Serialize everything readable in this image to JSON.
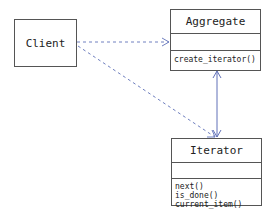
{
  "diagram": {
    "type": "UML class diagram",
    "pattern": "Iterator",
    "colors": {
      "box_border": "#555555",
      "text": "#222222",
      "dashed_arrow": "#7080c0",
      "solid_arrow": "#6070b8",
      "background": "#ffffff"
    },
    "nodes": {
      "client": {
        "label": "Client"
      },
      "aggregate": {
        "name": "Aggregate",
        "attributes": [],
        "operations": [
          "create_iterator()"
        ]
      },
      "iterator": {
        "name": "Iterator",
        "attributes": [],
        "operations": [
          "next()",
          "is_done()",
          "current_item()"
        ]
      }
    },
    "edges": [
      {
        "from": "Client",
        "to": "Aggregate",
        "style": "dashed",
        "arrow": "open"
      },
      {
        "from": "Client",
        "to": "Iterator",
        "style": "dashed",
        "arrow": "open"
      },
      {
        "from": "Aggregate",
        "to": "Iterator",
        "style": "solid",
        "arrow": "both"
      }
    ]
  }
}
